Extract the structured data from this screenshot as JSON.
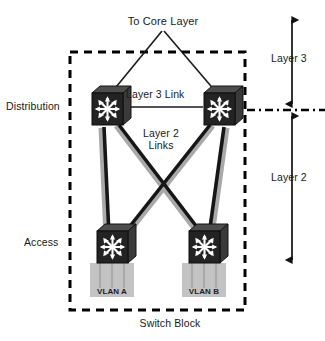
{
  "diagram": {
    "type": "network-topology",
    "canvas": {
      "width": 325,
      "height": 341
    },
    "colors": {
      "background": "#ffffff",
      "text": "#1a1a1a",
      "device_body": "#262626",
      "device_top": "#4a4a4a",
      "device_side": "#3a3a3a",
      "device_glyph": "#ffffff",
      "link_layer3": "#1a1a1a",
      "link_layer2": "#1a1a1a",
      "link_shadow": "#a8a8a8",
      "vlan_block": "#b5b5b5",
      "vlan_stem": "#6e6e6e",
      "boundary_dashed": "#000000",
      "layer_divider": "#000000"
    },
    "labels": {
      "core_layer": "To Core Layer",
      "layer3_link": "Layer 3 Link",
      "layer2_links": "Layer 2\nLinks",
      "layer2_links_line1": "Layer 2",
      "layer2_links_line2": "Links",
      "distribution": "Distribution",
      "access": "Access",
      "layer3": "Layer 3",
      "layer2": "Layer 2",
      "switch_block": "Switch Block",
      "vlan_a": "VLAN A",
      "vlan_b": "VLAN B"
    },
    "nodes": [
      {
        "id": "dist-left",
        "name": "distribution-switch-left",
        "tier": "Distribution",
        "x": 107,
        "y": 107
      },
      {
        "id": "dist-right",
        "name": "distribution-switch-right",
        "tier": "Distribution",
        "x": 219,
        "y": 107
      },
      {
        "id": "access-left",
        "name": "access-switch-left",
        "tier": "Access",
        "vlan": "VLAN A",
        "x": 112,
        "y": 245
      },
      {
        "id": "access-right",
        "name": "access-switch-right",
        "tier": "Access",
        "vlan": "VLAN B",
        "x": 204,
        "y": 245
      }
    ],
    "links": [
      {
        "from": "core",
        "to": "dist-left",
        "layer": "Layer 3",
        "style": "thin"
      },
      {
        "from": "core",
        "to": "dist-right",
        "layer": "Layer 3",
        "style": "thin"
      },
      {
        "from": "dist-left",
        "to": "dist-right",
        "layer": "Layer 3",
        "style": "thin",
        "label": "Layer 3 Link"
      },
      {
        "from": "dist-left",
        "to": "access-left",
        "layer": "Layer 2",
        "style": "thick"
      },
      {
        "from": "dist-left",
        "to": "access-right",
        "layer": "Layer 2",
        "style": "thick"
      },
      {
        "from": "dist-right",
        "to": "access-left",
        "layer": "Layer 2",
        "style": "thick"
      },
      {
        "from": "dist-right",
        "to": "access-right",
        "layer": "Layer 2",
        "style": "thick"
      }
    ],
    "boundary": {
      "name": "switch-block-boundary",
      "style": "dashed",
      "x": 70,
      "y": 52,
      "width": 175,
      "height": 258
    },
    "layer_divider": {
      "name": "layer3-layer2-divider",
      "style": "dash-dot",
      "y": 110,
      "x1": 248,
      "x2": 325
    },
    "layer_arrows": [
      {
        "name": "layer3-range-arrow",
        "label": "Layer 3",
        "x": 292,
        "y_top": 18,
        "y_bottom": 106
      },
      {
        "name": "layer2-range-arrow",
        "label": "Layer 2",
        "x": 292,
        "y_top": 114,
        "y_bottom": 262
      }
    ]
  }
}
